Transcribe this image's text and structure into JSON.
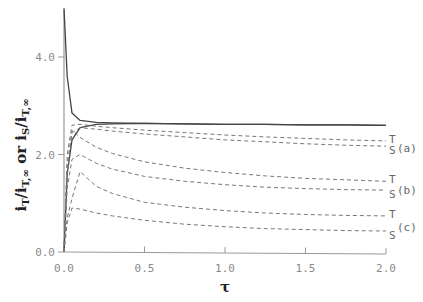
{
  "chart_data": {
    "type": "line",
    "title": "",
    "xlabel": "τ",
    "ylabel": "i_T/i_T,∞ or i_S/i_T,∞",
    "xlim": [
      0.0,
      2.0
    ],
    "ylim": [
      0.0,
      5.0
    ],
    "xticks": [
      "0.0",
      "0.5",
      "1.0",
      "1.5",
      "2.0"
    ],
    "yticks": [
      "0.0",
      "2.0",
      "4.0"
    ],
    "grid": false,
    "x": [
      0.0,
      0.02,
      0.05,
      0.1,
      0.2,
      0.3,
      0.5,
      0.75,
      1.0,
      1.25,
      1.5,
      1.75,
      2.0
    ],
    "series": [
      {
        "name": "solid-decay",
        "style": "solid",
        "values": [
          5.0,
          3.6,
          2.85,
          2.7,
          2.66,
          2.65,
          2.64,
          2.63,
          2.62,
          2.62,
          2.61,
          2.61,
          2.6
        ]
      },
      {
        "name": "solid-rise",
        "style": "solid",
        "values": [
          0.0,
          1.6,
          2.3,
          2.55,
          2.62,
          2.63,
          2.64,
          2.63,
          2.62,
          2.62,
          2.61,
          2.61,
          2.6
        ]
      },
      {
        "name": "(a) T",
        "style": "dashed",
        "label": "T",
        "group": "(a)",
        "values": [
          0.0,
          2.0,
          2.6,
          2.62,
          2.58,
          2.55,
          2.5,
          2.45,
          2.4,
          2.36,
          2.33,
          2.3,
          2.28
        ]
      },
      {
        "name": "(a) S",
        "style": "dashed",
        "label": "S",
        "group": "(a)",
        "values": [
          0.0,
          1.8,
          2.45,
          2.55,
          2.52,
          2.48,
          2.42,
          2.36,
          2.3,
          2.26,
          2.22,
          2.19,
          2.17
        ]
      },
      {
        "name": "(b) T",
        "style": "dashed",
        "label": "T",
        "group": "(b)",
        "values": [
          0.0,
          1.6,
          2.5,
          2.35,
          2.15,
          2.02,
          1.85,
          1.72,
          1.63,
          1.56,
          1.51,
          1.48,
          1.45
        ]
      },
      {
        "name": "(b) S",
        "style": "dashed",
        "label": "S",
        "group": "(b)",
        "values": [
          0.0,
          1.3,
          1.9,
          2.0,
          1.82,
          1.7,
          1.55,
          1.45,
          1.38,
          1.33,
          1.3,
          1.28,
          1.27
        ]
      },
      {
        "name": "(c) T",
        "style": "dashed",
        "label": "T",
        "group": "(c)",
        "values": [
          0.0,
          0.7,
          1.1,
          1.65,
          1.35,
          1.2,
          1.02,
          0.92,
          0.85,
          0.8,
          0.77,
          0.75,
          0.74
        ]
      },
      {
        "name": "(c) S",
        "style": "dashed",
        "label": "S",
        "group": "(c)",
        "values": [
          0.0,
          0.6,
          0.9,
          0.88,
          0.8,
          0.74,
          0.65,
          0.57,
          0.52,
          0.48,
          0.46,
          0.44,
          0.43
        ]
      }
    ],
    "curve_labels": [
      {
        "group": "(a)",
        "top": "T",
        "bottom": "S"
      },
      {
        "group": "(b)",
        "top": "T",
        "bottom": "S"
      },
      {
        "group": "(c)",
        "top": "T",
        "bottom": "S"
      }
    ],
    "legend": "none (inline labels at right)"
  },
  "axes": {
    "x_title": "τ",
    "y_title_main1": "i",
    "y_title_text": "iT/iT,∞ or iS/iT,∞"
  }
}
